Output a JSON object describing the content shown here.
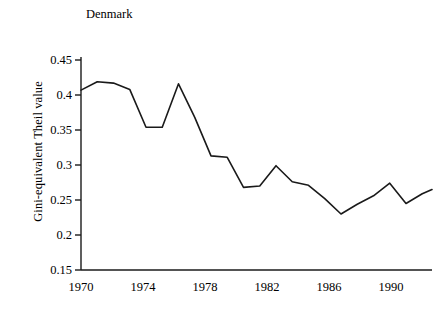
{
  "chart_data": {
    "type": "line",
    "title": "Denmark",
    "xlabel": "",
    "ylabel": "Gini-equivalent Theil value",
    "xlim": [
      1970,
      1991.6
    ],
    "ylim": [
      0.15,
      0.45
    ],
    "grid": false,
    "legend": "none",
    "x_ticks": [
      "1970",
      "1974",
      "1978",
      "1982",
      "1986",
      "1990"
    ],
    "x_tick_values": [
      1970,
      1974,
      1978,
      1982,
      1986,
      1990
    ],
    "y_ticks": [
      "0.15",
      "0.2",
      "0.25",
      "0.3",
      "0.35",
      "0.4",
      "0.45"
    ],
    "y_tick_values": [
      0.15,
      0.2,
      0.25,
      0.3,
      0.35,
      0.4,
      0.45
    ],
    "line_color": "#1a1a1a",
    "line_width": 1.6,
    "series": [
      {
        "name": "Denmark",
        "x": [
          1970,
          1971,
          1972,
          1973,
          1974,
          1975,
          1976,
          1977,
          1978,
          1979,
          1980,
          1981,
          1982,
          1983,
          1984,
          1985,
          1986,
          1987,
          1988,
          1989,
          1990,
          1991
        ],
        "values": [
          0.407,
          0.419,
          0.417,
          0.408,
          0.354,
          0.354,
          0.416,
          0.368,
          0.313,
          0.311,
          0.268,
          0.27,
          0.299,
          0.276,
          0.271,
          0.252,
          0.23,
          0.244,
          0.256,
          0.274,
          0.245,
          0.259
        ]
      }
    ],
    "last_point": {
      "x": 1991.6,
      "y": 0.265
    }
  },
  "axes": {
    "y_axis_name": "y-axis",
    "x_axis_name": "x-axis"
  }
}
